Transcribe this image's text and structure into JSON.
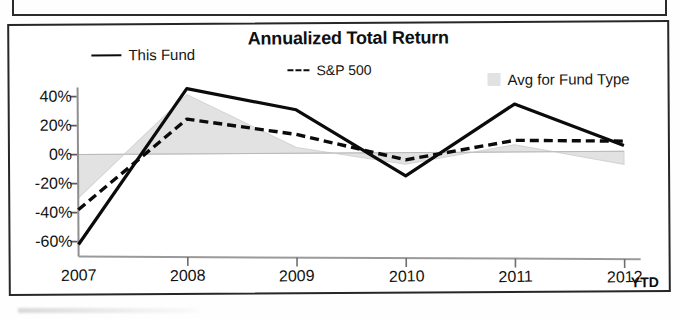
{
  "figure": {
    "title": "Annualized Total Return",
    "ytd_label": "YTD"
  },
  "legend": {
    "position": "top",
    "entries": [
      {
        "label": "This Fund",
        "marker": "solid-line-swatch",
        "color": "#0b0b0b"
      },
      {
        "label": "S&P 500",
        "marker": "dashed-line-swatch",
        "color": "#0b0b0b"
      },
      {
        "label": "Avg for Fund Type",
        "marker": "area-swatch",
        "color": "#e2e2e2"
      }
    ]
  },
  "axes": {
    "y_ticks": [
      "40%",
      "20%",
      "0%",
      "-20%",
      "-40%",
      "-60%"
    ],
    "x_ticks": [
      "2007",
      "2008",
      "2009",
      "2010",
      "2011",
      "2012"
    ]
  },
  "chart_data": {
    "type": "line",
    "title": "Annualized Total Return",
    "xlabel": "",
    "ylabel": "",
    "categories": [
      "2007",
      "2008",
      "2009",
      "2010",
      "2011",
      "2012"
    ],
    "x_tick_labels": [
      "2007",
      "2008",
      "2009",
      "2010",
      "2011",
      "2012"
    ],
    "y_tick_labels": [
      "40%",
      "20%",
      "0%",
      "-20%",
      "-40%",
      "-60%"
    ],
    "y_tick_values": [
      40,
      20,
      0,
      -20,
      -40,
      -60
    ],
    "ylim": [
      -70,
      50
    ],
    "yunit": "percent",
    "grid": false,
    "legend_position": "top",
    "annotations": [
      "YTD"
    ],
    "series": [
      {
        "name": "This Fund",
        "style": "solid",
        "color": "#0b0b0b",
        "values": [
          -62,
          45,
          30,
          -16,
          33,
          4
        ]
      },
      {
        "name": "S&P 500",
        "style": "dashed",
        "color": "#0b0b0b",
        "values": [
          -38,
          24,
          13,
          -5,
          8,
          7
        ]
      },
      {
        "name": "Avg for Fund Type",
        "style": "area",
        "color": "#e2e2e2",
        "values": [
          -30,
          41,
          4,
          -8,
          5,
          -9
        ]
      }
    ]
  }
}
